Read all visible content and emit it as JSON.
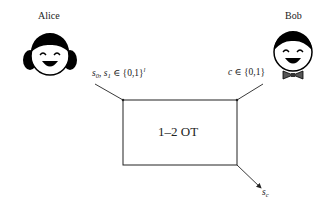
{
  "parties": {
    "alice": {
      "name": "Alice",
      "input_label": {
        "prefix": "s",
        "s0_sub": "0",
        "sep": ", ",
        "s1_prefix": "s",
        "s1_sub": "1",
        "set": " ∈ {0,1}",
        "exp": "l"
      }
    },
    "bob": {
      "name": "Bob",
      "input_label": {
        "var": "c",
        "set": " ∈ {0,1}"
      }
    }
  },
  "box": {
    "label": "1–2 OT"
  },
  "output": {
    "var": "s",
    "sub": "c"
  },
  "colors": {
    "line": "#222222",
    "face_fill": "#ffffff",
    "hair": "#000000",
    "bowtie": "#555555"
  }
}
